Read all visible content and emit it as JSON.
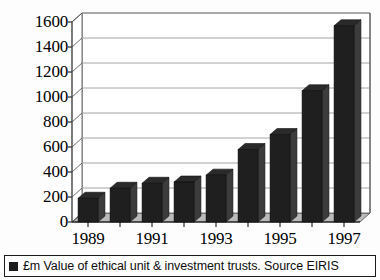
{
  "chart_data": {
    "type": "bar",
    "title": "",
    "subtitle": "",
    "xlabel": "",
    "ylabel": "",
    "categories": [
      "1989",
      "1990",
      "1991",
      "1992",
      "1993",
      "1994",
      "1995",
      "1996",
      "1997"
    ],
    "values": [
      190,
      270,
      310,
      320,
      375,
      580,
      700,
      1050,
      1570
    ],
    "ylim": [
      0,
      1600
    ],
    "ytick_values": [
      0,
      200,
      400,
      600,
      800,
      1000,
      1200,
      1400,
      1600
    ],
    "ytick_labels": [
      "0",
      "200",
      "400",
      "600",
      "800",
      "1000",
      "1200",
      "1400",
      "1600"
    ],
    "xtick_labels": [
      "1989",
      "",
      "1991",
      "",
      "1993",
      "",
      "1995",
      "",
      "1997"
    ],
    "visible_xtick_labels": [
      "1989",
      "1991",
      "1993",
      "1995",
      "1997"
    ],
    "grid": true,
    "grid_axis": "y",
    "legend_position": "bottom",
    "style": "3d-bar",
    "bar_color": "#1f1f1f",
    "bar_side_color": "#3c3c3c",
    "bar_top_color": "#2a2a2a",
    "floor_color": "#b9b9b9",
    "axis_color": "#4a4a4a",
    "grid_color": "#9a9a9a",
    "series": [
      {
        "name": "£m Value of ethical unit & investment trusts. Source EIRIS",
        "values": [
          190,
          270,
          310,
          320,
          375,
          580,
          700,
          1050,
          1570
        ]
      }
    ]
  },
  "legend": {
    "marker": "filled-square",
    "label": "£m Value of ethical unit & investment trusts. Source EIRIS"
  }
}
